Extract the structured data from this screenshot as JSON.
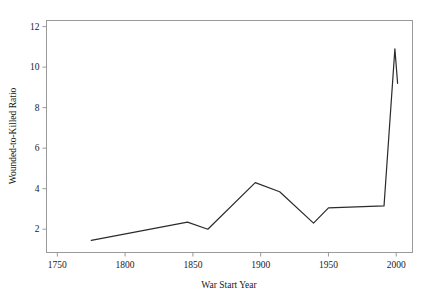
{
  "chart_data": {
    "type": "line",
    "title": "",
    "xlabel": "War Start Year",
    "ylabel": "Wounded-to-Killed Ratio",
    "xlim": [
      1742,
      2012
    ],
    "ylim": [
      0.85,
      12.3
    ],
    "grid": false,
    "legend": "none",
    "xticks": [
      1750,
      1800,
      1850,
      1900,
      1950,
      2000
    ],
    "xtick_labels": [
      "1750",
      "1800",
      "1850",
      "1900",
      "1950",
      "2000"
    ],
    "yticks": [
      2,
      4,
      6,
      8,
      10,
      12
    ],
    "ytick_labels": [
      "2",
      "4",
      "6",
      "8",
      "10",
      "12"
    ],
    "line_color": "#2b2b2b",
    "axis_color": "#9a9a9a",
    "series": [
      {
        "name": "Wounded-to-Killed Ratio",
        "x": [
          1775,
          1846,
          1861,
          1896,
          1914,
          1939,
          1950,
          1991,
          1999,
          2001
        ],
        "values": [
          1.45,
          2.35,
          2.0,
          4.3,
          3.85,
          2.3,
          3.05,
          3.15,
          10.9,
          9.2
        ]
      }
    ]
  },
  "axes": {
    "x_axis_title": "War Start Year",
    "y_axis_title": "Wounded-to-Killed Ratio"
  }
}
